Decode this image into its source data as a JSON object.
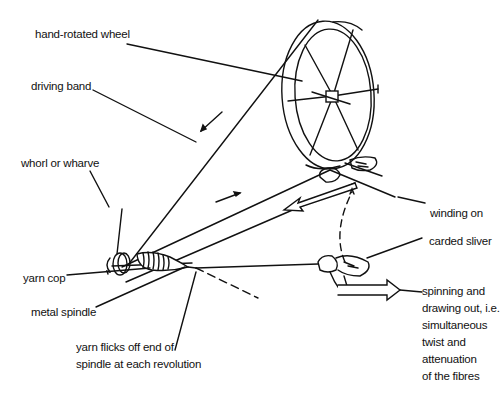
{
  "diagram": {
    "labels": {
      "wheel": "hand-rotated wheel",
      "band": "driving band",
      "whorl": "whorl or wharve",
      "winding": "winding on",
      "sliver": "carded sliver",
      "cop": "yarn cop",
      "spindle": "metal spindle",
      "flicks_1": "yarn flicks off end of",
      "flicks_2": "spindle at each revolution",
      "spin_1": "spinning and",
      "spin_2": "drawing out, i.e.",
      "spin_3": "simultaneous",
      "spin_4": "twist and",
      "spin_5": "attenuation",
      "spin_6": "of the fibres"
    },
    "stroke_color": "#111111",
    "background": "#ffffff"
  }
}
